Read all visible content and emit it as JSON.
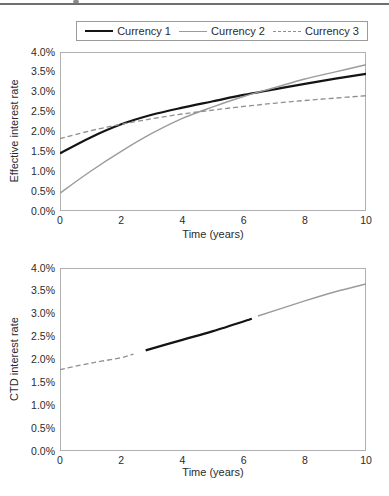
{
  "legend": {
    "entries": [
      {
        "label": "Currency 1",
        "color": "#141414",
        "width": 2.2,
        "dash": ""
      },
      {
        "label": "Currency 2",
        "color": "#9b9b9b",
        "width": 1.4,
        "dash": ""
      },
      {
        "label": "Currency 3",
        "color": "#8f8f8f",
        "width": 1.3,
        "dash": "5,3"
      }
    ]
  },
  "chart_data": [
    {
      "type": "line",
      "title": "",
      "xlabel": "Time (years)",
      "ylabel": "Effective interest rate",
      "xlim": [
        0,
        10
      ],
      "ylim": [
        0,
        4
      ],
      "grid": false,
      "legend_position": "top",
      "xticks": [
        "0",
        "2",
        "4",
        "6",
        "8",
        "10"
      ],
      "yticks": [
        "0.0%",
        "0.5%",
        "1.0%",
        "1.5%",
        "2.0%",
        "2.5%",
        "3.0%",
        "3.5%",
        "4.0%"
      ],
      "frame_color": "#b0b0b0",
      "series": [
        {
          "name": "Currency 1",
          "color": "#141414",
          "width": 2.2,
          "dash": "",
          "points": [
            [
              0,
              1.45
            ],
            [
              1,
              1.85
            ],
            [
              2,
              2.18
            ],
            [
              3,
              2.42
            ],
            [
              4,
              2.6
            ],
            [
              5,
              2.76
            ],
            [
              6,
              2.92
            ],
            [
              7,
              3.06
            ],
            [
              8,
              3.2
            ],
            [
              9,
              3.33
            ],
            [
              10,
              3.45
            ]
          ]
        },
        {
          "name": "Currency 2",
          "color": "#9b9b9b",
          "width": 1.4,
          "dash": "",
          "points": [
            [
              0,
              0.45
            ],
            [
              1,
              1.0
            ],
            [
              2,
              1.5
            ],
            [
              3,
              1.95
            ],
            [
              4,
              2.33
            ],
            [
              5,
              2.62
            ],
            [
              6,
              2.88
            ],
            [
              7,
              3.1
            ],
            [
              8,
              3.32
            ],
            [
              9,
              3.5
            ],
            [
              10,
              3.68
            ]
          ]
        },
        {
          "name": "Currency 3",
          "color": "#8f8f8f",
          "width": 1.3,
          "dash": "5,3",
          "points": [
            [
              0,
              1.82
            ],
            [
              1,
              2.02
            ],
            [
              2,
              2.18
            ],
            [
              3,
              2.32
            ],
            [
              4,
              2.44
            ],
            [
              5,
              2.54
            ],
            [
              6,
              2.63
            ],
            [
              7,
              2.71
            ],
            [
              8,
              2.78
            ],
            [
              9,
              2.84
            ],
            [
              10,
              2.9
            ]
          ]
        }
      ]
    },
    {
      "type": "line",
      "title": "",
      "xlabel": "Time (years)",
      "ylabel": "CTD interest rate",
      "xlim": [
        0,
        10
      ],
      "ylim": [
        0,
        4
      ],
      "grid": false,
      "xticks": [
        "0",
        "2",
        "4",
        "6",
        "8",
        "10"
      ],
      "yticks": [
        "0.0%",
        "0.5%",
        "1.0%",
        "1.5%",
        "2.0%",
        "2.5%",
        "3.0%",
        "3.5%",
        "4.0%"
      ],
      "frame_color": "#b0b0b0",
      "series": [
        {
          "name": "CTD segment (Currency 3)",
          "color": "#8f8f8f",
          "width": 1.3,
          "dash": "5,3",
          "points": [
            [
              0,
              1.78
            ],
            [
              1,
              1.92
            ],
            [
              2,
              2.04
            ],
            [
              2.4,
              2.12
            ]
          ]
        },
        {
          "name": "CTD segment (Currency 1)",
          "color": "#141414",
          "width": 2.2,
          "dash": "",
          "points": [
            [
              2.8,
              2.2
            ],
            [
              4,
              2.43
            ],
            [
              5,
              2.62
            ],
            [
              6.27,
              2.89
            ]
          ]
        },
        {
          "name": "CTD segment (Currency 2)",
          "color": "#9b9b9b",
          "width": 1.4,
          "dash": "",
          "points": [
            [
              6.47,
              2.95
            ],
            [
              8,
              3.28
            ],
            [
              9,
              3.48
            ],
            [
              10,
              3.65
            ]
          ]
        }
      ]
    }
  ]
}
